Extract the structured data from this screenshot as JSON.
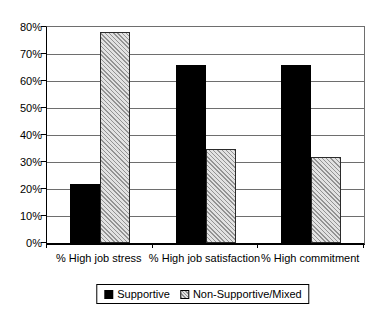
{
  "chart_data": {
    "type": "bar",
    "title": "",
    "xlabel": "",
    "ylabel": "",
    "categories": [
      "% High job stress",
      "% High job satisfaction",
      "% High commitment"
    ],
    "series": [
      {
        "name": "Supportive",
        "style": "solid",
        "values": [
          22,
          66,
          66
        ]
      },
      {
        "name": "Non-Supportive/Mixed",
        "style": "hatched",
        "values": [
          78,
          35,
          32
        ]
      }
    ],
    "ylim": [
      0,
      80
    ],
    "ytick_step": 10,
    "ytick_labels": [
      "0%",
      "10%",
      "20%",
      "30%",
      "40%",
      "50%",
      "60%",
      "70%",
      "80%"
    ],
    "grid": true,
    "legend_position": "bottom-center"
  },
  "colors": {
    "supportive_bar": "#000000",
    "hatch_background": "#e2e2e2",
    "hatch_line": "#939393",
    "gridline": "#6e6e6e",
    "axis": "#000000",
    "background": "#ffffff"
  },
  "layout_values": {
    "plot_left": 46,
    "plot_top": 26,
    "plot_width": 317,
    "plot_height": 216,
    "bar_width": 30,
    "legend_center_x": 203,
    "legend_top": 284
  }
}
